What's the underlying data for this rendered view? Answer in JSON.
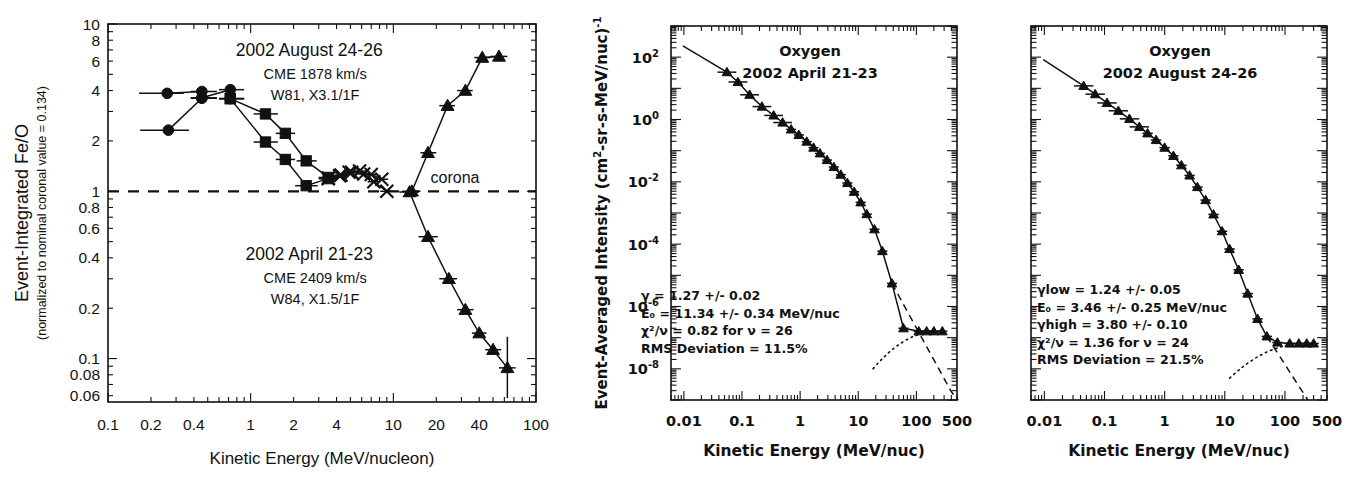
{
  "figure": {
    "panels": [
      "fe-o-ratio",
      "oxygen-spectrum-april",
      "oxygen-spectrum-august"
    ]
  },
  "chart_data": [
    {
      "id": "fe-o-ratio",
      "type": "line",
      "title": "",
      "xlabel": "Kinetic Energy (MeV/nucleon)",
      "ylabel": "Event-Integrated Fe/O",
      "ylabel_sub": "(normalized to nominal coronal value = 0.134)",
      "xscale": "log",
      "yscale": "log",
      "xlim": [
        0.1,
        100
      ],
      "ylim": [
        0.055,
        10
      ],
      "xticks": [
        0.1,
        0.2,
        0.4,
        1,
        2,
        4,
        10,
        20,
        40,
        100
      ],
      "xticklabels": [
        "0.1",
        "0.2",
        "0.4",
        "1",
        "2",
        "4",
        "10",
        "20",
        "40",
        "100"
      ],
      "yticks": [
        10,
        8,
        6,
        4,
        2,
        1,
        0.8,
        0.6,
        0.4,
        0.2,
        0.1,
        0.08,
        0.06
      ],
      "yticklabels": [
        "10",
        "8",
        "6",
        "4",
        "2",
        "1",
        "0.8",
        "0.6",
        "0.4",
        "0.2",
        "0.1",
        "0.08",
        "0.06"
      ],
      "grid": false,
      "reference_line": {
        "y": 1.0,
        "style": "dashed",
        "label": "corona"
      },
      "annotations": [
        {
          "name": "august-event-label",
          "lines": [
            "2002 August 24-26",
            "CME 1878 km/s",
            "W81, X3.1/1F"
          ],
          "x_frac": 0.47,
          "y_frac": 0.085
        },
        {
          "name": "april-event-label",
          "lines": [
            "2002 April 21-23",
            "CME 2409 km/s",
            "W84, X1.5/1F"
          ],
          "x_frac": 0.47,
          "y_frac": 0.625
        }
      ],
      "series": [
        {
          "name": "august-circles",
          "marker": "circle",
          "points": [
            {
              "x": 0.26,
              "y": 3.85,
              "xerr": [
                0.165,
                0.34
              ]
            },
            {
              "x": 0.455,
              "y": 3.95,
              "xerr": [
                0.38,
                0.58
              ]
            },
            {
              "x": 0.455,
              "y": 3.62,
              "xerr": [
                0.38,
                0.58
              ]
            },
            {
              "x": 0.72,
              "y": 4.05,
              "xerr": [
                0.6,
                0.9
              ]
            },
            {
              "x": 0.72,
              "y": 3.58,
              "xerr": [
                0.6,
                0.9
              ]
            }
          ]
        },
        {
          "name": "august-circles-low",
          "marker": "circle",
          "points": [
            {
              "x": 0.265,
              "y": 2.32,
              "xerr": [
                0.168,
                0.37
              ]
            },
            {
              "x": 0.455,
              "y": 3.6,
              "xerr": [
                0.38,
                0.58
              ]
            }
          ]
        },
        {
          "name": "august-squares-upper",
          "marker": "square",
          "points": [
            {
              "x": 0.72,
              "y": 3.58,
              "xerr": [
                0.6,
                0.9
              ]
            },
            {
              "x": 1.27,
              "y": 2.9,
              "xerr": [
                1.05,
                1.55
              ]
            },
            {
              "x": 1.75,
              "y": 2.22,
              "xerr": [
                1.5,
                2.05
              ]
            },
            {
              "x": 2.45,
              "y": 1.52,
              "xerr": [
                2.1,
                2.9
              ]
            },
            {
              "x": 3.5,
              "y": 1.21,
              "xerr": [
                3.0,
                4.1
              ]
            }
          ]
        },
        {
          "name": "august-squares-lower",
          "marker": "square",
          "points": [
            {
              "x": 0.72,
              "y": 3.58,
              "xerr": [
                0.6,
                0.9
              ]
            },
            {
              "x": 1.27,
              "y": 1.97,
              "xerr": [
                1.05,
                1.55
              ]
            },
            {
              "x": 1.75,
              "y": 1.55,
              "xerr": [
                1.5,
                2.05
              ]
            },
            {
              "x": 2.45,
              "y": 1.08,
              "xerr": [
                2.05,
                2.95
              ]
            },
            {
              "x": 3.5,
              "y": 1.19,
              "xerr": [
                3.0,
                4.1
              ]
            }
          ]
        },
        {
          "name": "august-crosses",
          "marker": "x",
          "points": [
            {
              "x": 3.5,
              "y": 1.2,
              "xerr": [
                3.0,
                4.1
              ]
            },
            {
              "x": 4.2,
              "y": 1.24,
              "xerr": [
                3.8,
                4.7
              ]
            },
            {
              "x": 4.9,
              "y": 1.3,
              "xerr": [
                4.4,
                5.5
              ]
            },
            {
              "x": 5.8,
              "y": 1.32,
              "xerr": [
                5.2,
                6.5
              ]
            },
            {
              "x": 7.0,
              "y": 1.26,
              "xerr": [
                6.3,
                7.8
              ]
            },
            {
              "x": 8.3,
              "y": 1.18,
              "xerr": [
                7.5,
                9.2
              ]
            }
          ]
        },
        {
          "name": "august-triangles-rising",
          "marker": "triangle",
          "points": [
            {
              "x": 13.5,
              "y": 1.0,
              "xerr": [
                11.5,
                15.5
              ]
            },
            {
              "x": 17.5,
              "y": 1.7,
              "xerr": [
                15.5,
                20.0
              ]
            },
            {
              "x": 24.0,
              "y": 3.25,
              "xerr": [
                21.0,
                27.0
              ]
            },
            {
              "x": 32.0,
              "y": 4.0,
              "xerr": [
                28.0,
                36.0
              ]
            },
            {
              "x": 42.0,
              "y": 6.3,
              "xerr": [
                37.0,
                48.0
              ]
            },
            {
              "x": 55.0,
              "y": 6.4,
              "xerr": [
                48.0,
                63.0
              ]
            }
          ]
        },
        {
          "name": "april-crosses",
          "marker": "x",
          "points": [
            {
              "x": 3.5,
              "y": 1.19,
              "xerr": [
                3.05,
                4.05
              ]
            },
            {
              "x": 4.3,
              "y": 1.25,
              "xerr": [
                3.9,
                4.8
              ]
            },
            {
              "x": 5.1,
              "y": 1.3,
              "xerr": [
                4.6,
                5.7
              ]
            },
            {
              "x": 6.2,
              "y": 1.27,
              "xerr": [
                5.6,
                6.9
              ]
            },
            {
              "x": 7.3,
              "y": 1.14,
              "xerr": [
                6.6,
                8.1
              ]
            },
            {
              "x": 9.0,
              "y": 1.0,
              "xerr": [
                8.1,
                10.0
              ]
            }
          ]
        },
        {
          "name": "april-triangles-falling",
          "marker": "triangle",
          "points": [
            {
              "x": 13.0,
              "y": 0.99,
              "xerr": [
                11.0,
                15.0
              ]
            },
            {
              "x": 17.5,
              "y": 0.535,
              "xerr": [
                15.0,
                20.5
              ]
            },
            {
              "x": 24.5,
              "y": 0.3,
              "xerr": [
                21.0,
                28.0
              ]
            },
            {
              "x": 32.0,
              "y": 0.196,
              "xerr": [
                28.0,
                36.5
              ]
            },
            {
              "x": 40.0,
              "y": 0.142,
              "xerr": [
                35.5,
                45.0
              ]
            },
            {
              "x": 50.0,
              "y": 0.113,
              "xerr": [
                44.0,
                57.0
              ]
            },
            {
              "x": 63.0,
              "y": 0.088,
              "xerr": [
                55.0,
                72.0
              ],
              "yerr": [
                0.058,
                0.135
              ]
            }
          ]
        }
      ]
    },
    {
      "id": "oxygen-spectrum-april",
      "type": "line",
      "title_lines": [
        "Oxygen",
        "2002 April 21-23"
      ],
      "xlabel": "Kinetic Energy (MeV/nuc)",
      "ylabel": "Event-Averaged Intensity (cm",
      "ylabel_parts": {
        "pre": "Event-Averaged Intensity (cm",
        "sup1": "2",
        "mid": "-sr-s-MeV/nuc)",
        "sup2": "-1"
      },
      "xscale": "log",
      "yscale": "log",
      "xlim": [
        0.006,
        500
      ],
      "ylim": [
        1e-09,
        1000
      ],
      "xticks": [
        0.01,
        0.1,
        1,
        10,
        100,
        500
      ],
      "xticklabels": [
        "0.01",
        "0.1",
        "1",
        "10",
        "100",
        "500"
      ],
      "yticks": [
        100,
        1,
        0.01,
        0.0001,
        1e-06,
        1e-08
      ],
      "yticklabels": [
        "10",
        "10",
        "10",
        "10",
        "10",
        "10"
      ],
      "ytickexp": [
        "2",
        "0",
        "-2",
        "-4",
        "-6",
        "-8"
      ],
      "grid": false,
      "fit_params": [
        "γ =  1.27 +/-  0.02",
        "E₀ =  11.34 +/-  0.34 MeV/nuc",
        "χ²/ν =  0.82 for ν = 26",
        "RMS Deviation =  11.5%"
      ],
      "spectrum_points": [
        {
          "x": 0.055,
          "y": 33.0
        },
        {
          "x": 0.085,
          "y": 16.0
        },
        {
          "x": 0.135,
          "y": 6.2
        },
        {
          "x": 0.22,
          "y": 2.6
        },
        {
          "x": 0.35,
          "y": 1.35
        },
        {
          "x": 0.5,
          "y": 0.8
        },
        {
          "x": 0.7,
          "y": 0.48
        },
        {
          "x": 0.95,
          "y": 0.32
        },
        {
          "x": 1.3,
          "y": 0.195
        },
        {
          "x": 1.7,
          "y": 0.125
        },
        {
          "x": 2.2,
          "y": 0.082
        },
        {
          "x": 2.9,
          "y": 0.05
        },
        {
          "x": 3.8,
          "y": 0.03
        },
        {
          "x": 5.0,
          "y": 0.017
        },
        {
          "x": 6.5,
          "y": 0.0092
        },
        {
          "x": 8.5,
          "y": 0.0048
        },
        {
          "x": 11.0,
          "y": 0.0022
        },
        {
          "x": 14.0,
          "y": 0.00092
        },
        {
          "x": 19.0,
          "y": 0.0003
        },
        {
          "x": 26.0,
          "y": 6e-05
        },
        {
          "x": 38.0,
          "y": 5.5e-06
        },
        {
          "x": 60.0,
          "y": 2e-07
        },
        {
          "x": 110.0,
          "y": 1.6e-07
        },
        {
          "x": 150.0,
          "y": 1.6e-07
        },
        {
          "x": 200.0,
          "y": 1.6e-07
        },
        {
          "x": 280.0,
          "y": 1.6e-07
        }
      ]
    },
    {
      "id": "oxygen-spectrum-august",
      "type": "line",
      "title_lines": [
        "Oxygen",
        "2002 August 24-26"
      ],
      "xlabel": "Kinetic Energy (MeV/nuc)",
      "xscale": "log",
      "yscale": "log",
      "xlim": [
        0.006,
        500
      ],
      "ylim": [
        1e-09,
        1000
      ],
      "xticks": [
        0.01,
        0.1,
        1,
        10,
        100,
        500
      ],
      "xticklabels": [
        "0.01",
        "0.1",
        "1",
        "10",
        "100",
        "500"
      ],
      "grid": false,
      "fit_params": [
        "γlow =  1.24 +/-  0.05",
        "E₀ =  3.46 +/-  0.25 MeV/nuc",
        "γhigh =  3.80 +/-  0.10",
        "χ²/ν =  1.36 for ν =  24",
        "RMS Deviation =  21.5%"
      ],
      "spectrum_points": [
        {
          "x": 0.045,
          "y": 12.0
        },
        {
          "x": 0.07,
          "y": 6.5
        },
        {
          "x": 0.11,
          "y": 3.4
        },
        {
          "x": 0.17,
          "y": 1.9
        },
        {
          "x": 0.26,
          "y": 1.05
        },
        {
          "x": 0.38,
          "y": 0.58
        },
        {
          "x": 0.52,
          "y": 0.36
        },
        {
          "x": 0.72,
          "y": 0.22
        },
        {
          "x": 1.0,
          "y": 0.125
        },
        {
          "x": 1.4,
          "y": 0.068
        },
        {
          "x": 1.9,
          "y": 0.034
        },
        {
          "x": 2.6,
          "y": 0.016
        },
        {
          "x": 3.5,
          "y": 0.0068
        },
        {
          "x": 4.8,
          "y": 0.0026
        },
        {
          "x": 6.5,
          "y": 0.0009
        },
        {
          "x": 9.0,
          "y": 0.00026
        },
        {
          "x": 12.0,
          "y": 7e-05
        },
        {
          "x": 17.0,
          "y": 1.5e-05
        },
        {
          "x": 24.0,
          "y": 2.6e-06
        },
        {
          "x": 35.0,
          "y": 4e-07
        },
        {
          "x": 50.0,
          "y": 1.1e-07
        },
        {
          "x": 75.0,
          "y": 7e-08
        },
        {
          "x": 120.0,
          "y": 6.5e-08
        },
        {
          "x": 170.0,
          "y": 6.5e-08
        },
        {
          "x": 230.0,
          "y": 6.5e-08
        },
        {
          "x": 300.0,
          "y": 6.5e-08
        }
      ]
    }
  ]
}
